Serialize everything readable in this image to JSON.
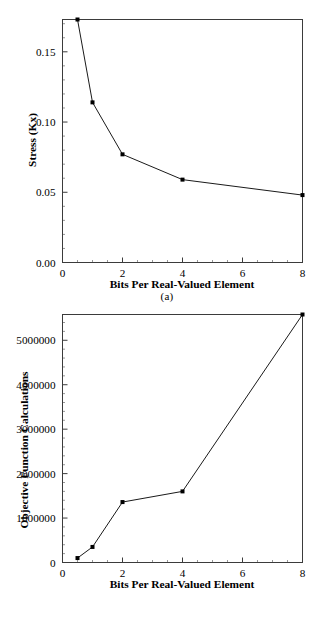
{
  "figure": {
    "panels": [
      {
        "caption": "(a)",
        "chart_ref": 0
      },
      {
        "caption": "(b)",
        "chart_ref": 1
      }
    ]
  },
  "chart_data": [
    {
      "type": "line",
      "title": "",
      "xlabel": "Bits Per Real-Valued Element",
      "ylabel": "Stress (Kx)",
      "x": [
        0.5,
        1,
        2,
        4,
        8
      ],
      "values": [
        0.173,
        0.114,
        0.077,
        0.059,
        0.048
      ],
      "series": [
        {
          "name": "Stress (Kx)",
          "values": [
            0.173,
            0.114,
            0.077,
            0.059,
            0.048
          ]
        }
      ],
      "xlim": [
        0,
        8
      ],
      "ylim": [
        0,
        0.173
      ],
      "xticks": [
        0,
        2,
        4,
        6,
        8
      ],
      "xticklabels": [
        "0",
        "2",
        "4",
        "6",
        "8"
      ],
      "yticks": [
        0.0,
        0.05,
        0.1,
        0.15
      ],
      "yticklabels": [
        "0.00",
        "0.05",
        "0.10",
        "0.15"
      ],
      "grid": false,
      "legend": "none",
      "marker": "square"
    },
    {
      "type": "line",
      "title": "",
      "xlabel": "Bits Per Real-Valued Element",
      "ylabel": "Objective Function Calculations",
      "x": [
        0.5,
        1,
        2,
        4,
        8
      ],
      "values": [
        100000,
        350000,
        1360000,
        1600000,
        5580000
      ],
      "series": [
        {
          "name": "Objective Function Calculations",
          "values": [
            100000,
            350000,
            1360000,
            1600000,
            5580000
          ]
        }
      ],
      "xlim": [
        0,
        8
      ],
      "ylim": [
        0,
        5580000
      ],
      "xticks": [
        0,
        2,
        4,
        6,
        8
      ],
      "xticklabels": [
        "0",
        "2",
        "4",
        "6",
        "8"
      ],
      "yticks": [
        0,
        1000000,
        2000000,
        3000000,
        4000000,
        5000000
      ],
      "yticklabels": [
        "0",
        "1000000",
        "2000000",
        "3000000",
        "4000000",
        "5000000"
      ],
      "grid": false,
      "legend": "none",
      "marker": "square"
    }
  ],
  "colors": {
    "line": "#1a1a1a",
    "frame": "#3b3b3b",
    "marker": "#000000",
    "background": "#ffffff"
  }
}
